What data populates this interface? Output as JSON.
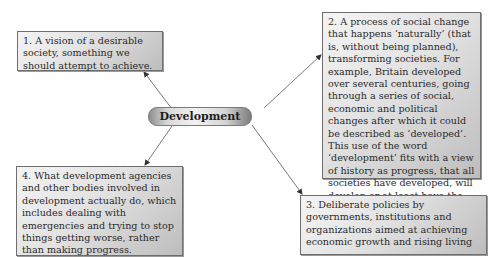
{
  "diagram": {
    "center": {
      "label": "Development"
    },
    "nodes": [
      {
        "id": "1",
        "text": "1.  A vision of a desirable society, something we should attempt to achieve."
      },
      {
        "id": "2",
        "text": "2.  A process of social change that happens ‘naturally’ (that is, without being planned), transforming societies. For example, Britain developed over several centuries, going through a series of social, economic and political changes after which it could be described as ‘developed’. This use of the word ‘development’ fits with a view of history as progress, that all societies have developed, will develop or at least have the potential to develop."
      },
      {
        "id": "3",
        "text": "3.  Deliberate policies by governments, institutions and organizations aimed at achieving economic growth and rising living"
      },
      {
        "id": "4",
        "text": "4.  What development agencies and other bodies involved in development actually do, which includes dealing with emergencies and trying to stop things getting worse, rather than making progress."
      }
    ],
    "edges": [
      {
        "from": "center",
        "to": "1"
      },
      {
        "from": "center",
        "to": "2"
      },
      {
        "from": "center",
        "to": "3"
      },
      {
        "from": "center",
        "to": "4"
      }
    ],
    "colors": {
      "box_border": "#6e6e6e",
      "text": "#2a2a2a",
      "arrow": "#555555"
    }
  }
}
